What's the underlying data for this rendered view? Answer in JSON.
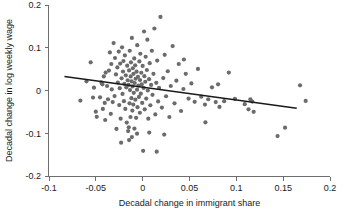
{
  "chart_data": {
    "type": "scatter",
    "title": "",
    "xlabel": "Decadal change in immigrant share",
    "ylabel": "Decadal change in log weekly wage",
    "xlim": [
      -0.1,
      0.2
    ],
    "ylim": [
      -0.2,
      0.2
    ],
    "xticks": [
      -0.1,
      -0.05,
      0,
      0.05,
      0.1,
      0.15,
      0.2
    ],
    "xticklabels": [
      "-0.1",
      "-0.05",
      "0",
      "0.05",
      "0.1",
      "0.15",
      "0.2"
    ],
    "yticks": [
      -0.2,
      -0.1,
      0,
      0.1,
      0.2
    ],
    "yticklabels": [
      "-0.2",
      "-0.1",
      "0",
      "0.1",
      "0.2"
    ],
    "grid": false,
    "legend": null,
    "marker_color": "#6b6b6b",
    "line_color": "#1a1a1a",
    "axis_color": "#6e6e6e",
    "fit_line": {
      "name": "linear fit",
      "x_start": -0.0835,
      "y_start": 0.0325,
      "x_end": 0.1645,
      "y_end": -0.0415
    },
    "series": [
      {
        "name": "observations",
        "points": [
          [
            -0.0665,
            -0.0235
          ],
          [
            -0.06,
            0.0215
          ],
          [
            -0.0555,
            0.066
          ],
          [
            -0.053,
            -0.0165
          ],
          [
            -0.052,
            0.0065
          ],
          [
            -0.05,
            -0.0495
          ],
          [
            -0.049,
            -0.0615
          ],
          [
            -0.0455,
            -0.016
          ],
          [
            -0.044,
            0.019
          ],
          [
            -0.043,
            0.0145
          ],
          [
            -0.0425,
            -0.043
          ],
          [
            -0.0415,
            0.033
          ],
          [
            -0.04,
            -0.069
          ],
          [
            -0.0395,
            0.042
          ],
          [
            -0.038,
            0.0105
          ],
          [
            -0.037,
            -0.0205
          ],
          [
            -0.036,
            0.0465
          ],
          [
            -0.035,
            0.089
          ],
          [
            -0.034,
            -0.0545
          ],
          [
            -0.0335,
            0.062
          ],
          [
            -0.033,
            0.0025
          ],
          [
            -0.032,
            -0.027
          ],
          [
            -0.031,
            0.111
          ],
          [
            -0.03,
            -0.013
          ],
          [
            -0.0295,
            0.076
          ],
          [
            -0.0285,
            0.0375
          ],
          [
            -0.028,
            -0.09
          ],
          [
            -0.027,
            0.054
          ],
          [
            -0.0265,
            0.0185
          ],
          [
            -0.0255,
            0.091
          ],
          [
            -0.025,
            -0.034
          ],
          [
            -0.0245,
            0.0055
          ],
          [
            -0.024,
            0.063
          ],
          [
            -0.0235,
            -0.066
          ],
          [
            -0.0225,
            0.0285
          ],
          [
            -0.022,
            0.101
          ],
          [
            -0.0215,
            -0.008
          ],
          [
            -0.021,
            0.0445
          ],
          [
            -0.0205,
            0.069
          ],
          [
            -0.02,
            -0.025
          ],
          [
            -0.0195,
            0.0155
          ],
          [
            -0.019,
            0.082
          ],
          [
            -0.0185,
            -0.043
          ],
          [
            -0.018,
            0.0355
          ],
          [
            -0.0175,
            0.0075
          ],
          [
            -0.017,
            -0.075
          ],
          [
            -0.0165,
            0.058
          ],
          [
            -0.016,
            0.024
          ],
          [
            -0.0155,
            -0.095
          ],
          [
            -0.015,
            0.013
          ],
          [
            -0.0148,
            -0.086
          ],
          [
            -0.0145,
            0.047
          ],
          [
            -0.014,
            -0.03
          ],
          [
            -0.0138,
            0.093
          ],
          [
            -0.0135,
            0.001
          ],
          [
            -0.013,
            -0.062
          ],
          [
            -0.0128,
            0.033
          ],
          [
            -0.0125,
            0.066
          ],
          [
            -0.012,
            -0.018
          ],
          [
            -0.0118,
            0.0215
          ],
          [
            -0.0115,
            0.123
          ],
          [
            -0.011,
            -0.047
          ],
          [
            -0.0108,
            0.0095
          ],
          [
            -0.0105,
            0.052
          ],
          [
            -0.01,
            -0.033
          ],
          [
            -0.0098,
            0.039
          ],
          [
            -0.0095,
            -0.0055
          ],
          [
            -0.009,
            0.075
          ],
          [
            -0.0088,
            -0.089
          ],
          [
            -0.0085,
            0.0175
          ],
          [
            -0.008,
            0.059
          ],
          [
            -0.0078,
            -0.0215
          ],
          [
            -0.0075,
            0.0275
          ],
          [
            -0.007,
            -0.064
          ],
          [
            -0.0065,
            0.044
          ],
          [
            -0.006,
            0.002
          ],
          [
            -0.0058,
            0.106
          ],
          [
            -0.0055,
            -0.039
          ],
          [
            -0.005,
            0.032
          ],
          [
            -0.0045,
            0.0115
          ],
          [
            -0.004,
            -0.015
          ],
          [
            -0.0035,
            0.068
          ],
          [
            -0.003,
            -0.052
          ],
          [
            -0.0028,
            0.0245
          ],
          [
            -0.0025,
            0.086
          ],
          [
            -0.002,
            -0.0075
          ],
          [
            -0.0015,
            0.0415
          ],
          [
            -0.001,
            0.0145
          ],
          [
            -0.0005,
            -0.029
          ],
          [
            0.0,
            0.0575
          ],
          [
            0.0005,
            -0.141
          ],
          [
            0.001,
            0.006
          ],
          [
            0.0015,
            0.138
          ],
          [
            0.0018,
            0.0335
          ],
          [
            0.0022,
            -0.044
          ],
          [
            0.0028,
            0.0205
          ],
          [
            0.0032,
            0.079
          ],
          [
            0.0038,
            -0.019
          ],
          [
            0.0045,
            0.048
          ],
          [
            0.005,
            0.119
          ],
          [
            0.0055,
            0.0
          ],
          [
            0.006,
            -0.066
          ],
          [
            0.0068,
            0.0265
          ],
          [
            0.0075,
            0.064
          ],
          [
            0.0082,
            -0.0345
          ],
          [
            0.009,
            0.013
          ],
          [
            0.0098,
            0.093
          ],
          [
            0.0105,
            -0.01
          ],
          [
            0.0115,
            0.039
          ],
          [
            0.0125,
            0.145
          ],
          [
            0.0135,
            -0.056
          ],
          [
            0.0145,
            0.018
          ],
          [
            0.0155,
            0.07
          ],
          [
            0.0165,
            -0.0255
          ],
          [
            0.0175,
            0.006
          ],
          [
            0.019,
            0.172
          ],
          [
            0.0205,
            -0.04
          ],
          [
            0.022,
            0.029
          ],
          [
            0.0235,
            0.0835
          ],
          [
            0.025,
            -0.0135
          ],
          [
            0.0268,
            0.045
          ],
          [
            0.0285,
            -0.062
          ],
          [
            0.03,
            0.0105
          ],
          [
            0.032,
            0.104
          ],
          [
            0.034,
            -0.03
          ],
          [
            0.036,
            0.023
          ],
          [
            0.0385,
            0.062
          ],
          [
            0.041,
            -0.048
          ],
          [
            0.0435,
            0.0035
          ],
          [
            0.046,
            0.039
          ],
          [
            0.049,
            -0.019
          ],
          [
            0.052,
            0.0165
          ],
          [
            0.0555,
            -0.0265
          ],
          [
            0.059,
            0.0505
          ],
          [
            0.0625,
            -0.0145
          ],
          [
            0.0665,
            -0.033
          ],
          [
            0.07,
            -0.0205
          ],
          [
            0.074,
            0.0075
          ],
          [
            0.078,
            -0.027
          ],
          [
            0.0805,
            0.0145
          ],
          [
            0.082,
            -0.0385
          ],
          [
            0.087,
            -0.025
          ],
          [
            0.092,
            0.042
          ],
          [
            0.0985,
            -0.0195
          ],
          [
            0.109,
            -0.032
          ],
          [
            0.113,
            -0.044
          ],
          [
            0.115,
            -0.0205
          ],
          [
            0.117,
            -0.026
          ],
          [
            0.1185,
            -0.05
          ],
          [
            0.144,
            -0.1065
          ],
          [
            0.152,
            -0.087
          ],
          [
            0.168,
            0.012
          ],
          [
            0.174,
            -0.0245
          ],
          [
            0.067,
            -0.0745
          ],
          [
            0.007,
            -0.0985
          ],
          [
            0.023,
            -0.103
          ],
          [
            -0.023,
            -0.122
          ],
          [
            -0.006,
            -0.101
          ],
          [
            -0.0145,
            -0.116
          ],
          [
            0.015,
            -0.143
          ],
          [
            -0.0405,
            -0.029
          ],
          [
            0.044,
            0.0725
          ],
          [
            -0.0115,
            -0.109
          ]
        ]
      }
    ]
  }
}
